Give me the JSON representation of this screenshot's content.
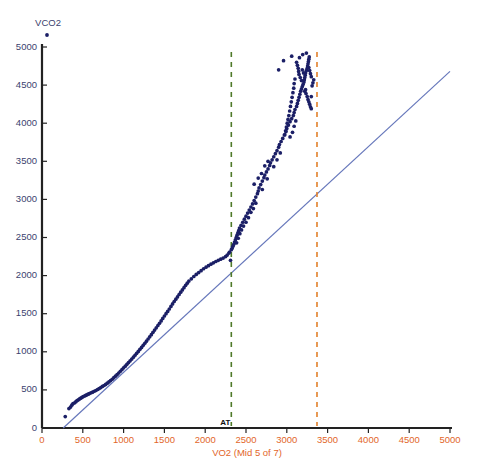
{
  "chart_data": {
    "type": "scatter",
    "title": "VCO2",
    "xlabel": "VO2 (Mid 5 of 7)",
    "ylabel": "VCO2",
    "xlim": [
      0,
      5000
    ],
    "ylim": [
      0,
      5000
    ],
    "xticks": [
      0,
      500,
      1000,
      1500,
      2000,
      2500,
      3000,
      3500,
      4000,
      4500,
      5000
    ],
    "yticks": [
      0,
      500,
      1000,
      1500,
      2000,
      2500,
      3000,
      3500,
      4000,
      4500,
      5000
    ],
    "xtick_labels": [
      "0",
      "500",
      "1000",
      "1500",
      "2000",
      "2500",
      "3000",
      "3500",
      "4000",
      "4500",
      "5000"
    ],
    "ytick_labels": [
      "0",
      "500",
      "1000",
      "1500",
      "2000",
      "2500",
      "3000",
      "3500",
      "4000",
      "4500",
      "5000"
    ],
    "grid": false,
    "legend": "none",
    "colors": {
      "points": "#1b1f66",
      "identity_line": "#6677bb",
      "at_line": "#4f7a2a",
      "rc_line": "#e2802a",
      "x_axis_text": "#e2662a",
      "y_axis_text": "#3b3f6e",
      "axis": "#222222"
    },
    "annotations": [
      {
        "name": "AT",
        "label": "AT",
        "x": 2320,
        "style": "green-dashed-vline"
      },
      {
        "name": "RC",
        "label": "",
        "x": 3370,
        "style": "orange-dashed-vline"
      }
    ],
    "reference_line": {
      "name": "identity-line",
      "x0": 260,
      "y0": 0,
      "x1": 5000,
      "y1": 4680
    },
    "series": [
      {
        "name": "VCO2 vs VO2",
        "marker": "filled-circle",
        "points": [
          [
            285,
            150
          ],
          [
            330,
            255
          ],
          [
            350,
            275
          ],
          [
            365,
            300
          ],
          [
            380,
            320
          ],
          [
            400,
            330
          ],
          [
            415,
            345
          ],
          [
            430,
            360
          ],
          [
            445,
            370
          ],
          [
            460,
            382
          ],
          [
            475,
            392
          ],
          [
            490,
            402
          ],
          [
            505,
            412
          ],
          [
            520,
            420
          ],
          [
            535,
            428
          ],
          [
            550,
            436
          ],
          [
            565,
            444
          ],
          [
            580,
            452
          ],
          [
            600,
            462
          ],
          [
            620,
            470
          ],
          [
            640,
            482
          ],
          [
            660,
            492
          ],
          [
            680,
            505
          ],
          [
            700,
            518
          ],
          [
            720,
            530
          ],
          [
            740,
            545
          ],
          [
            760,
            558
          ],
          [
            780,
            572
          ],
          [
            800,
            588
          ],
          [
            820,
            605
          ],
          [
            840,
            622
          ],
          [
            860,
            640
          ],
          [
            880,
            660
          ],
          [
            900,
            680
          ],
          [
            920,
            700
          ],
          [
            940,
            722
          ],
          [
            960,
            745
          ],
          [
            980,
            768
          ],
          [
            1000,
            790
          ],
          [
            1020,
            812
          ],
          [
            1040,
            835
          ],
          [
            1060,
            858
          ],
          [
            1080,
            882
          ],
          [
            1100,
            905
          ],
          [
            1120,
            930
          ],
          [
            1140,
            955
          ],
          [
            1160,
            980
          ],
          [
            1180,
            1005
          ],
          [
            1200,
            1032
          ],
          [
            1220,
            1058
          ],
          [
            1240,
            1085
          ],
          [
            1260,
            1112
          ],
          [
            1280,
            1140
          ],
          [
            1300,
            1168
          ],
          [
            1320,
            1196
          ],
          [
            1340,
            1225
          ],
          [
            1360,
            1255
          ],
          [
            1380,
            1285
          ],
          [
            1400,
            1315
          ],
          [
            1420,
            1345
          ],
          [
            1440,
            1375
          ],
          [
            1460,
            1405
          ],
          [
            1480,
            1438
          ],
          [
            1500,
            1470
          ],
          [
            1520,
            1500
          ],
          [
            1540,
            1530
          ],
          [
            1560,
            1562
          ],
          [
            1580,
            1595
          ],
          [
            1600,
            1628
          ],
          [
            1620,
            1660
          ],
          [
            1640,
            1690
          ],
          [
            1660,
            1720
          ],
          [
            1680,
            1752
          ],
          [
            1700,
            1782
          ],
          [
            1720,
            1812
          ],
          [
            1740,
            1842
          ],
          [
            1760,
            1872
          ],
          [
            1780,
            1900
          ],
          [
            1800,
            1928
          ],
          [
            1830,
            1958
          ],
          [
            1860,
            1988
          ],
          [
            1890,
            2015
          ],
          [
            1920,
            2040
          ],
          [
            1950,
            2065
          ],
          [
            1980,
            2090
          ],
          [
            2010,
            2110
          ],
          [
            2040,
            2130
          ],
          [
            2070,
            2150
          ],
          [
            2100,
            2168
          ],
          [
            2130,
            2185
          ],
          [
            2160,
            2200
          ],
          [
            2190,
            2215
          ],
          [
            2220,
            2230
          ],
          [
            2250,
            2250
          ],
          [
            2270,
            2270
          ],
          [
            2290,
            2295
          ],
          [
            2300,
            2310
          ],
          [
            2310,
            2200
          ],
          [
            2320,
            2340
          ],
          [
            2330,
            2360
          ],
          [
            2340,
            2385
          ],
          [
            2350,
            2410
          ],
          [
            2360,
            2440
          ],
          [
            2370,
            2470
          ],
          [
            2380,
            2500
          ],
          [
            2390,
            2530
          ],
          [
            2400,
            2560
          ],
          [
            2410,
            2590
          ],
          [
            2420,
            2625
          ],
          [
            2440,
            2660
          ],
          [
            2460,
            2700
          ],
          [
            2480,
            2740
          ],
          [
            2500,
            2780
          ],
          [
            2520,
            2820
          ],
          [
            2540,
            2860
          ],
          [
            2560,
            2900
          ],
          [
            2580,
            2940
          ],
          [
            2600,
            2985
          ],
          [
            2620,
            3030
          ],
          [
            2640,
            3075
          ],
          [
            2650,
            3110
          ],
          [
            2660,
            3150
          ],
          [
            2680,
            3195
          ],
          [
            2700,
            3240
          ],
          [
            2720,
            3285
          ],
          [
            2730,
            3320
          ],
          [
            2750,
            3360
          ],
          [
            2770,
            3400
          ],
          [
            2790,
            3445
          ],
          [
            2800,
            3480
          ],
          [
            2820,
            3520
          ],
          [
            2840,
            3560
          ],
          [
            2860,
            3600
          ],
          [
            2880,
            3640
          ],
          [
            2900,
            3685
          ],
          [
            2910,
            3720
          ],
          [
            2930,
            3760
          ],
          [
            2950,
            3800
          ],
          [
            2970,
            3845
          ],
          [
            2990,
            3890
          ],
          [
            3000,
            3930
          ],
          [
            3020,
            3975
          ],
          [
            3040,
            4020
          ],
          [
            3060,
            4060
          ],
          [
            3080,
            4100
          ],
          [
            3090,
            4140
          ],
          [
            3100,
            4180
          ],
          [
            3120,
            4220
          ],
          [
            3130,
            4260
          ],
          [
            3140,
            4300
          ],
          [
            3150,
            4340
          ],
          [
            3160,
            4380
          ],
          [
            3170,
            4420
          ],
          [
            3180,
            4450
          ],
          [
            3190,
            4480
          ],
          [
            3200,
            4510
          ],
          [
            3210,
            4540
          ],
          [
            3215,
            4570
          ],
          [
            3220,
            4600
          ],
          [
            3225,
            4630
          ],
          [
            3230,
            4660
          ],
          [
            3240,
            4690
          ],
          [
            3250,
            4720
          ],
          [
            3255,
            4750
          ],
          [
            3260,
            4780
          ],
          [
            3265,
            4810
          ],
          [
            3270,
            4840
          ],
          [
            3275,
            4870
          ],
          [
            3190,
            4700
          ],
          [
            3205,
            4660
          ],
          [
            3220,
            4420
          ],
          [
            3235,
            4390
          ],
          [
            3250,
            4350
          ],
          [
            3260,
            4310
          ],
          [
            3270,
            4280
          ],
          [
            3280,
            4250
          ],
          [
            3290,
            4215
          ],
          [
            3300,
            4190
          ],
          [
            3310,
            4490
          ],
          [
            3320,
            4530
          ],
          [
            3330,
            4570
          ],
          [
            3300,
            4610
          ],
          [
            3290,
            4650
          ],
          [
            3280,
            4690
          ],
          [
            3270,
            4730
          ],
          [
            3180,
            4560
          ],
          [
            3165,
            4600
          ],
          [
            3150,
            4640
          ],
          [
            3145,
            4680
          ],
          [
            3140,
            4720
          ],
          [
            3130,
            4760
          ],
          [
            3120,
            4800
          ],
          [
            3155,
            4860
          ],
          [
            3195,
            4900
          ],
          [
            3240,
            4920
          ],
          [
            3100,
            4580
          ],
          [
            3090,
            4520
          ],
          [
            3085,
            4460
          ],
          [
            3075,
            4400
          ],
          [
            3065,
            4340
          ],
          [
            3055,
            4280
          ],
          [
            3045,
            4220
          ],
          [
            3035,
            4160
          ],
          [
            3025,
            4100
          ],
          [
            3015,
            4050
          ],
          [
            3005,
            4000
          ],
          [
            2995,
            3950
          ],
          [
            2985,
            3900
          ],
          [
            2975,
            3850
          ],
          [
            3040,
            3820
          ],
          [
            3070,
            3880
          ],
          [
            3090,
            3960
          ],
          [
            3110,
            4030
          ],
          [
            2900,
            4700
          ],
          [
            2960,
            4820
          ],
          [
            3060,
            4880
          ],
          [
            3230,
            4440
          ],
          [
            3300,
            4350
          ],
          [
            2700,
            3130
          ],
          [
            2760,
            3270
          ],
          [
            2840,
            3430
          ],
          [
            2880,
            3520
          ],
          [
            2920,
            3610
          ],
          [
            2620,
            2950
          ],
          [
            2590,
            2880
          ],
          [
            2560,
            2830
          ],
          [
            2530,
            2760
          ],
          [
            2500,
            2700
          ],
          [
            2470,
            2650
          ],
          [
            2445,
            2600
          ],
          [
            2425,
            2550
          ],
          [
            2405,
            2490
          ],
          [
            2385,
            2430
          ],
          [
            2600,
            3200
          ],
          [
            2650,
            3280
          ],
          [
            2690,
            3340
          ],
          [
            2730,
            3440
          ],
          [
            2770,
            3500
          ]
        ]
      }
    ]
  },
  "axes": {
    "y_title": "VCO2",
    "x_title": "VO2 (Mid 5 of 7)",
    "at_marker_label": "AT",
    "title_marker_icon": "data-point-marker"
  }
}
